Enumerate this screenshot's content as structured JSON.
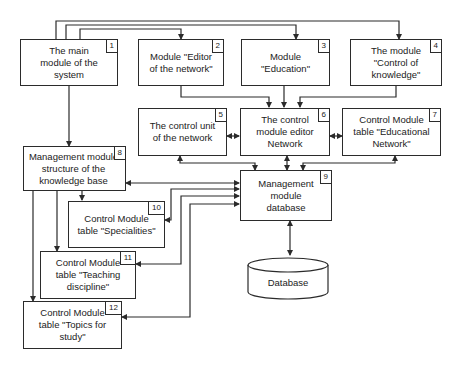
{
  "diagram": {
    "nodes": [
      {
        "id": 1,
        "label": "The main\nmodule of the\nsystem"
      },
      {
        "id": 2,
        "label": "Module \"Editor\nof the network\""
      },
      {
        "id": 3,
        "label": "Module\n\"Education\""
      },
      {
        "id": 4,
        "label": "The module\n\"Control of\nknowledge\""
      },
      {
        "id": 5,
        "label": "The control unit\nof the network"
      },
      {
        "id": 6,
        "label": "The control\nmodule editor\nNetwork"
      },
      {
        "id": 7,
        "label": "Control Module\ntable  \"Educational\nNetwork\""
      },
      {
        "id": 8,
        "label": "Management module\nstructure of the\nknowledge base"
      },
      {
        "id": 9,
        "label": "Management\nmodule\ndatabase"
      },
      {
        "id": 10,
        "label": "Control Module\ntable \"Specialities\""
      },
      {
        "id": 11,
        "label": "Control Module\ntable \"Teaching\ndiscipline\""
      },
      {
        "id": 12,
        "label": "Control Module\ntable \"Topics for\nstudy\""
      }
    ],
    "database": {
      "label": "Database"
    },
    "numbers": [
      "1",
      "2",
      "3",
      "4",
      "5",
      "6",
      "7",
      "8",
      "9",
      "10",
      "11",
      "12"
    ],
    "edges": [
      {
        "from": 1,
        "to": 2,
        "type": "arrow"
      },
      {
        "from": 1,
        "to": 3,
        "type": "arrow"
      },
      {
        "from": 1,
        "to": 4,
        "type": "arrow"
      },
      {
        "from": 1,
        "to": 8,
        "type": "arrow"
      },
      {
        "from": 2,
        "to": 6,
        "type": "arrow"
      },
      {
        "from": 3,
        "to": 6,
        "type": "arrow"
      },
      {
        "from": 4,
        "to": 6,
        "type": "arrow"
      },
      {
        "from": 5,
        "to": 6,
        "type": "bidirectional"
      },
      {
        "from": 6,
        "to": 7,
        "type": "bidirectional"
      },
      {
        "from": 5,
        "to": 9,
        "type": "bidirectional"
      },
      {
        "from": 6,
        "to": 9,
        "type": "bidirectional"
      },
      {
        "from": 7,
        "to": 9,
        "type": "bidirectional"
      },
      {
        "from": 8,
        "to": 9,
        "type": "bidirectional"
      },
      {
        "from": 8,
        "to": 10,
        "type": "arrow"
      },
      {
        "from": 8,
        "to": 11,
        "type": "arrow"
      },
      {
        "from": 8,
        "to": 12,
        "type": "arrow"
      },
      {
        "from": 9,
        "to": 10,
        "type": "bidirectional"
      },
      {
        "from": 9,
        "to": 11,
        "type": "bidirectional"
      },
      {
        "from": 9,
        "to": 12,
        "type": "bidirectional"
      },
      {
        "from": 9,
        "to": "database",
        "type": "bidirectional"
      }
    ]
  }
}
